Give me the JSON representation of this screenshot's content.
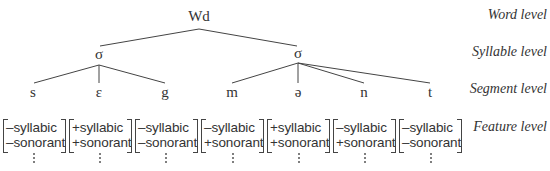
{
  "diagram": {
    "type": "phonological-hierarchy-tree",
    "word": {
      "label": "Wd"
    },
    "syllables": [
      {
        "label": "σ",
        "segments": [
          0,
          1,
          2
        ]
      },
      {
        "label": "σ",
        "segments": [
          3,
          4,
          5,
          6
        ]
      }
    ],
    "segments": [
      {
        "symbol": "s",
        "features": [
          "–syllabic",
          "–sonorant"
        ]
      },
      {
        "symbol": "ε",
        "features": [
          "+syllabic",
          "+sonorant"
        ]
      },
      {
        "symbol": "g",
        "features": [
          "–syllabic",
          "–sonorant"
        ]
      },
      {
        "symbol": "m",
        "features": [
          "–syllabic",
          "+sonorant"
        ]
      },
      {
        "symbol": "ə",
        "features": [
          "+syllabic",
          "+sonorant"
        ]
      },
      {
        "symbol": "n",
        "features": [
          "–syllabic",
          "+sonorant"
        ]
      },
      {
        "symbol": "t",
        "features": [
          "–syllabic",
          "–sonorant"
        ]
      }
    ],
    "continuation_marker": "⋮"
  },
  "levels": {
    "word": "Word level",
    "syllable": "Syllable level",
    "segment": "Segment level",
    "feature": "Feature level"
  }
}
